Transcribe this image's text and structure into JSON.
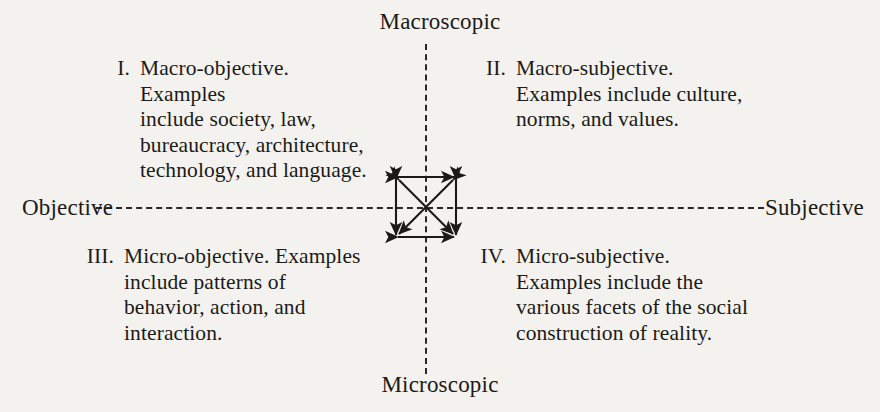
{
  "figure": {
    "type": "two-by-two-quadrant-diagram",
    "background_color": "#f4f2ee",
    "ink_color": "#1b1a18"
  },
  "axes": {
    "vertical": {
      "top_label": "Macroscopic",
      "bottom_label": "Microscopic",
      "style": "dashed"
    },
    "horizontal": {
      "left_label": "Objective",
      "right_label": "Subjective",
      "style": "dashed"
    }
  },
  "center": {
    "shape": "square-with-bidirectional-arrows",
    "arrow_count": 6,
    "description": "Square whose four sides and two diagonals are all double-headed arrows"
  },
  "quadrants": [
    {
      "id": "q1",
      "numeral": "I.",
      "title": "Macro-objective.",
      "lines": [
        "Macro-objective. Examples",
        "include society, law,",
        "bureaucracy, architecture,",
        "technology, and language."
      ]
    },
    {
      "id": "q2",
      "numeral": "II.",
      "title": "Macro-subjective.",
      "lines": [
        "Macro-subjective.",
        "Examples include culture,",
        "norms, and values."
      ]
    },
    {
      "id": "q3",
      "numeral": "III.",
      "title": "Micro-objective.",
      "lines": [
        "Micro-objective. Examples",
        "include patterns of",
        "behavior, action, and",
        "interaction."
      ]
    },
    {
      "id": "q4",
      "numeral": "IV.",
      "title": "Micro-subjective.",
      "lines": [
        "Micro-subjective.",
        "Examples include the",
        "various facets of the social",
        "construction of reality."
      ]
    }
  ]
}
